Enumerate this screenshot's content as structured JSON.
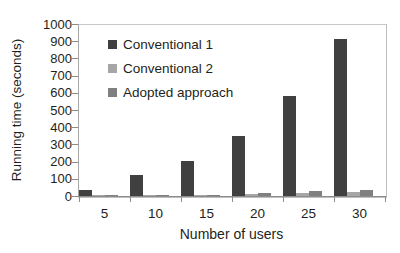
{
  "chart_data": {
    "type": "bar",
    "title": "",
    "subtitle": "",
    "xlabel": "Number of users",
    "ylabel": "Running time (seconds)",
    "categories": [
      "5",
      "10",
      "15",
      "20",
      "25",
      "30"
    ],
    "series": [
      {
        "name": "Conventional 1",
        "color": "#404040",
        "values": [
          35,
          120,
          205,
          350,
          580,
          910
        ]
      },
      {
        "name": "Conventional 2",
        "color": "#A6A6A6",
        "values": [
          3,
          5,
          8,
          12,
          18,
          25
        ]
      },
      {
        "name": "Adopted approach",
        "color": "#808080",
        "values": [
          2,
          4,
          6,
          18,
          28,
          35
        ]
      }
    ],
    "ylim": [
      0,
      1000
    ],
    "ytick_labels": [
      "1000",
      "900",
      "800",
      "700",
      "600",
      "500",
      "400",
      "300",
      "200",
      "100",
      "0"
    ],
    "ytick_values": [
      1000,
      900,
      800,
      700,
      600,
      500,
      400,
      300,
      200,
      100,
      0
    ],
    "grid": false,
    "legend_position": "upper-left-inside",
    "legend_entries": [
      "Conventional 1",
      "Conventional 2",
      "Adopted approach"
    ],
    "annotations": []
  },
  "axes": {
    "y_title": "Running time (seconds)",
    "x_title": "Number of users"
  },
  "colors": {
    "series_1": "#404040",
    "series_2": "#A6A6A6",
    "series_3": "#808080",
    "frame": "#BFBFBF",
    "text": "#231F20",
    "background": "#FFFFFF"
  }
}
